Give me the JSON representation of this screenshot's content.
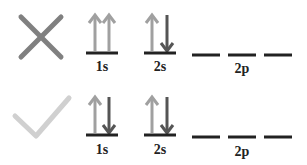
{
  "rows": [
    {
      "status": "incorrect",
      "status_icon": "x-mark-icon",
      "orbitals": {
        "1s": {
          "label": "1s",
          "electrons": [
            "up",
            "up"
          ]
        },
        "2s": {
          "label": "2s",
          "electrons": [
            "up",
            "down"
          ]
        },
        "2p": {
          "label": "2p",
          "electrons": [
            [],
            [],
            []
          ]
        }
      }
    },
    {
      "status": "correct",
      "status_icon": "check-mark-icon",
      "orbitals": {
        "1s": {
          "label": "1s",
          "electrons": [
            "up",
            "down"
          ]
        },
        "2s": {
          "label": "2s",
          "electrons": [
            "up",
            "down"
          ]
        },
        "2p": {
          "label": "2p",
          "electrons": [
            [],
            [],
            []
          ]
        }
      }
    }
  ],
  "colors": {
    "x_mark": "#808080",
    "check_mark": "#d0d0d0",
    "up_arrow": "#a0a0a0",
    "down_arrow": "#555555",
    "orbital_line": "#222222",
    "label": "#222222"
  }
}
